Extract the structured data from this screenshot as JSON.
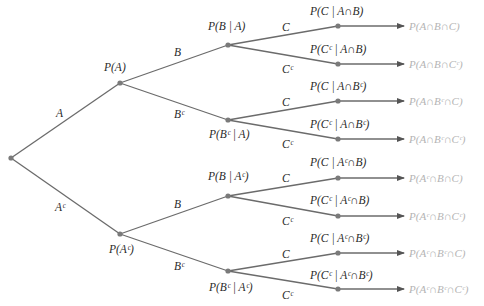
{
  "diagram": {
    "type": "probability-tree",
    "colors": {
      "edge": "#6b6b6b",
      "node": "#7a7a7a",
      "label": "#2a2a2a",
      "result": "#b4b4b4"
    },
    "root": {
      "x": 11,
      "y": 158
    },
    "level1": [
      {
        "id": "A",
        "x": 120,
        "y": 83,
        "edge_label": "A",
        "edge_label_pos": [
          56,
          117
        ],
        "prob": "P(A)",
        "prob_pos": [
          104,
          71
        ]
      },
      {
        "id": "Ac",
        "x": 120,
        "y": 234,
        "edge_label": "Aᶜ",
        "edge_label_pos": [
          55,
          211
        ],
        "prob": "P(Aᶜ)",
        "prob_pos": [
          109,
          253
        ]
      }
    ],
    "level2": [
      {
        "parent": 0,
        "x": 228,
        "y": 45,
        "edge_label": "B",
        "edge_label_pos": [
          174,
          56
        ],
        "prob": "P(B | A)",
        "prob_pos": [
          208,
          30
        ]
      },
      {
        "parent": 0,
        "x": 228,
        "y": 120,
        "edge_label": "Bᶜ",
        "edge_label_pos": [
          174,
          118
        ],
        "prob": "P(Bᶜ | A)",
        "prob_pos": [
          209,
          138
        ]
      },
      {
        "parent": 1,
        "x": 228,
        "y": 196,
        "edge_label": "B",
        "edge_label_pos": [
          174,
          208
        ],
        "prob": "P(B | Aᶜ)",
        "prob_pos": [
          208,
          180
        ]
      },
      {
        "parent": 1,
        "x": 228,
        "y": 271,
        "edge_label": "Bᶜ",
        "edge_label_pos": [
          174,
          270
        ],
        "prob": "P(Bᶜ | Aᶜ)",
        "prob_pos": [
          209,
          291
        ]
      }
    ],
    "level3": [
      {
        "parent": 0,
        "x": 338,
        "y": 26,
        "edge_label": "C",
        "edge_label_pos": [
          282,
          31
        ],
        "prob": "P(C | A∩B)",
        "prob_pos": [
          310,
          15
        ],
        "result": "P(A∩B∩C)"
      },
      {
        "parent": 0,
        "x": 338,
        "y": 64,
        "edge_label": "Cᶜ",
        "edge_label_pos": [
          282,
          73
        ],
        "prob": "P(Cᶜ | A∩B)",
        "prob_pos": [
          310,
          53
        ],
        "result": "P(A∩B∩Cᶜ)"
      },
      {
        "parent": 1,
        "x": 338,
        "y": 101,
        "edge_label": "C",
        "edge_label_pos": [
          282,
          106
        ],
        "prob": "P(C | A∩Bᶜ)",
        "prob_pos": [
          310,
          90
        ],
        "result": "P(A∩Bᶜ∩C)"
      },
      {
        "parent": 1,
        "x": 338,
        "y": 139,
        "edge_label": "Cᶜ",
        "edge_label_pos": [
          282,
          148
        ],
        "prob": "P(Cᶜ | A∩Bᶜ)",
        "prob_pos": [
          310,
          128
        ],
        "result": "P(A∩Bᶜ∩Cᶜ)"
      },
      {
        "parent": 2,
        "x": 338,
        "y": 178,
        "edge_label": "C",
        "edge_label_pos": [
          282,
          182
        ],
        "prob": "P(C | Aᶜ∩B)",
        "prob_pos": [
          310,
          166
        ],
        "result": "P(Aᶜ∩B∩C)"
      },
      {
        "parent": 2,
        "x": 338,
        "y": 216,
        "edge_label": "Cᶜ",
        "edge_label_pos": [
          282,
          225
        ],
        "prob": "P(Cᶜ | Aᶜ∩B)",
        "prob_pos": [
          310,
          204
        ],
        "result": "P(Aᶜ∩B∩Cᶜ)"
      },
      {
        "parent": 3,
        "x": 338,
        "y": 253,
        "edge_label": "C",
        "edge_label_pos": [
          282,
          258
        ],
        "prob": "P(C | Aᶜ∩Bᶜ)",
        "prob_pos": [
          310,
          242
        ],
        "result": "P(Aᶜ∩Bᶜ∩C)"
      },
      {
        "parent": 3,
        "x": 338,
        "y": 289,
        "edge_label": "Cᶜ",
        "edge_label_pos": [
          282,
          299
        ],
        "prob": "P(Cᶜ | Aᶜ∩Bᶜ)",
        "prob_pos": [
          310,
          279
        ],
        "result": "P(Aᶜ∩Bᶜ∩Cᶜ)"
      }
    ],
    "arrow_end_x": 404,
    "result_x": 409
  }
}
